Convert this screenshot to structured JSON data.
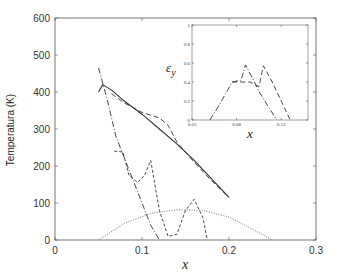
{
  "chart_data": [
    {
      "type": "line",
      "title": "",
      "xlabel": "x",
      "ylabel": "Temperatura (K)",
      "xlim": [
        0,
        0.3
      ],
      "ylim": [
        0,
        600
      ],
      "xticks": [
        "0",
        "0.1",
        "0.2",
        "0.3"
      ],
      "yticks": [
        "0",
        "100",
        "200",
        "300",
        "400",
        "500",
        "600"
      ],
      "grid": false,
      "legend": null,
      "series": [
        {
          "name": "solid",
          "style": "solid",
          "x": [
            0.05,
            0.055,
            0.065,
            0.08,
            0.1,
            0.12,
            0.14,
            0.16,
            0.18,
            0.2
          ],
          "y": [
            400,
            420,
            405,
            375,
            340,
            300,
            260,
            215,
            165,
            115
          ]
        },
        {
          "name": "long-dashed",
          "style": "dashed",
          "x": [
            0.065,
            0.08,
            0.1,
            0.12,
            0.13,
            0.14,
            0.16,
            0.18,
            0.2
          ],
          "y": [
            395,
            370,
            345,
            330,
            310,
            265,
            210,
            160,
            115
          ]
        },
        {
          "name": "dash-dot",
          "style": "dashdot",
          "x": [
            0.05,
            0.06,
            0.07,
            0.08,
            0.09,
            0.1,
            0.11,
            0.12
          ],
          "y": [
            465,
            380,
            280,
            220,
            160,
            100,
            40,
            0
          ]
        },
        {
          "name": "short-dashed",
          "style": "shortdash",
          "x": [
            0.068,
            0.078,
            0.085,
            0.095,
            0.103,
            0.11,
            0.12,
            0.13,
            0.14,
            0.15,
            0.16,
            0.17,
            0.175
          ],
          "y": [
            240,
            238,
            175,
            155,
            175,
            215,
            80,
            10,
            15,
            80,
            110,
            60,
            0
          ]
        },
        {
          "name": "dotted",
          "style": "dotted",
          "x": [
            0.05,
            0.08,
            0.11,
            0.14,
            0.17,
            0.2,
            0.22,
            0.25
          ],
          "y": [
            0,
            45,
            72,
            82,
            80,
            62,
            38,
            0
          ]
        }
      ]
    },
    {
      "type": "line",
      "title": "inset",
      "xlabel": "x",
      "ylabel": "ε_y",
      "xlim": [
        0.03,
        0.16
      ],
      "ylim": [
        0,
        1
      ],
      "xticks": [
        "0.03",
        "0.08",
        "0.13"
      ],
      "yticks": [
        "0",
        "0.2",
        "0.4",
        "0.6",
        "0.8",
        "1"
      ],
      "grid": false,
      "series": [
        {
          "name": "dash-dot",
          "style": "dashdot",
          "x": [
            0.05,
            0.06,
            0.075,
            0.085,
            0.09,
            0.1,
            0.105,
            0.115,
            0.125
          ],
          "y": [
            0,
            0.15,
            0.4,
            0.42,
            0.58,
            0.4,
            0.3,
            0.15,
            0
          ]
        },
        {
          "name": "dashed",
          "style": "dashed",
          "x": [
            0.075,
            0.085,
            0.095,
            0.105,
            0.11,
            0.12,
            0.13,
            0.14
          ],
          "y": [
            0.4,
            0.4,
            0.4,
            0.35,
            0.57,
            0.4,
            0.2,
            0
          ]
        }
      ]
    }
  ],
  "labels": {
    "ylabel": "Temperatura (K)",
    "xlabel": "x",
    "inset_ylabel": "ε",
    "inset_ylabel_sub": "y",
    "inset_xlabel": "x"
  },
  "axis_ticks": {
    "x": [
      "0",
      "0.1",
      "0.2",
      "0.3"
    ],
    "y": [
      "0",
      "100",
      "200",
      "300",
      "400",
      "500",
      "600"
    ],
    "inset_x": [
      "0.03",
      "0.08",
      "0.13"
    ],
    "inset_y": [
      "0",
      "0.2",
      "0.4",
      "0.6",
      "0.8",
      "1"
    ]
  }
}
